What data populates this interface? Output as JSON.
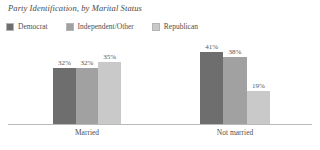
{
  "chart_data": {
    "type": "bar",
    "title": "Party Identification, by Marital Status",
    "xlabel": "",
    "ylabel": "",
    "ylim": [
      0,
      50
    ],
    "grid": false,
    "legend_position": "top-left",
    "categories": [
      "Married",
      "Not married"
    ],
    "series": [
      {
        "name": "Democrat",
        "color": "#6e6e6e",
        "values": [
          32,
          41
        ],
        "labels": [
          "32%",
          "41%"
        ]
      },
      {
        "name": "Independent/Other",
        "color": "#a1a1a1",
        "values": [
          32,
          38
        ],
        "labels": [
          "32%",
          "38%"
        ]
      },
      {
        "name": "Republican",
        "color": "#c9c9c9",
        "values": [
          35,
          19
        ],
        "labels": [
          "35%",
          "19%"
        ]
      }
    ]
  },
  "colors": {
    "democrat": "#6e6e6e",
    "independent_other": "#a1a1a1",
    "republican": "#c9c9c9",
    "axis": "#b9b9b9",
    "text": "#4f4f4f",
    "title_text": "#4a4a4a"
  }
}
